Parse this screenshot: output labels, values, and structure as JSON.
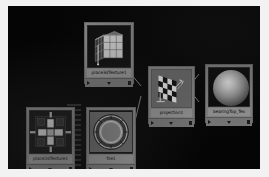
{
  "app": {
    "window_title": "Hypershade Work Area",
    "canvas_background": "#050505",
    "node_background": "#8a8a8a",
    "wire_color": "#bdbdbd"
  },
  "graph": {
    "nodes": [
      {
        "id": "place3dTexture1",
        "label": "place3dTexture1",
        "swatch": "cube-placement-gizmo",
        "x": 76,
        "y": 16,
        "w": 50,
        "h": 62,
        "buttons": [
          "input-arrow",
          "expand-down",
          "output-square"
        ]
      },
      {
        "id": "place2dTexture1",
        "label": "place2dTexture1",
        "swatch": "mechanical-plate",
        "x": 18,
        "y": 101,
        "w": 49,
        "h": 63,
        "buttons": [
          "input-arrow",
          "expand-down",
          "output-square"
        ]
      },
      {
        "id": "file1",
        "label": "file1",
        "swatch": "bearing-ring-texture",
        "x": 78,
        "y": 101,
        "w": 50,
        "h": 63,
        "buttons": [
          "input-arrow",
          "expand-down",
          "output-square"
        ]
      },
      {
        "id": "projection1",
        "label": "projection1",
        "swatch": "checkerboard-projection",
        "x": 140,
        "y": 60,
        "w": 47,
        "h": 58,
        "buttons": [
          "input-arrow",
          "expand-down",
          "output-square"
        ]
      },
      {
        "id": "bearingTop_Tex",
        "label": "bearingTop_Tex",
        "swatch": "shaded-sphere",
        "x": 197,
        "y": 58,
        "w": 48,
        "h": 59,
        "buttons": [
          "input-arrow",
          "expand-down",
          "output-square"
        ]
      }
    ],
    "connections": [
      {
        "from": "place3dTexture1",
        "to": "projection1",
        "type": "single"
      },
      {
        "from": "place2dTexture1",
        "to": "file1",
        "type": "multi-bus",
        "strand_count": 13
      },
      {
        "from": "file1",
        "to": "projection1",
        "type": "single"
      },
      {
        "from": "projection1",
        "to": "bearingTop_Tex",
        "type": "double"
      }
    ]
  }
}
